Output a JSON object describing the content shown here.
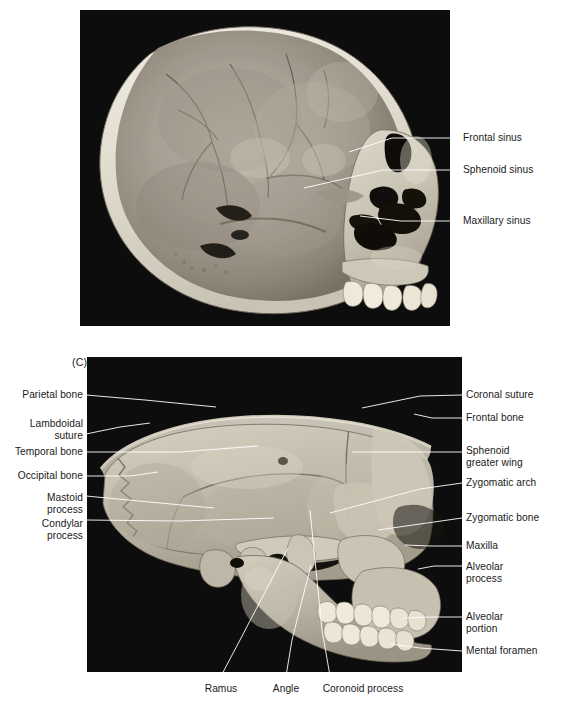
{
  "figure": {
    "panels": [
      {
        "tag": "(B)",
        "tag_pos": {
          "x": 80,
          "y": 8
        },
        "plate": {
          "x": 80,
          "y": 10,
          "w": 370,
          "h": 316
        },
        "subject": "midsagittal section of skull showing paranasal sinuses",
        "labels": [
          {
            "name": "frontal-sinus",
            "text": "Frontal sinus",
            "x": 463,
            "y": 132,
            "align": "left",
            "leader": [
              [
                458,
                138
              ],
              [
                392,
                138
              ],
              [
                349,
                152
              ]
            ]
          },
          {
            "name": "sphenoid-sinus",
            "text": "Sphenoid sinus",
            "x": 463,
            "y": 164,
            "align": "left",
            "leader": [
              [
                458,
                170
              ],
              [
                383,
                170
              ],
              [
                304,
                188
              ]
            ]
          },
          {
            "name": "maxillary-sinus",
            "text": "Maxillary sinus",
            "x": 463,
            "y": 215,
            "align": "left",
            "leader": [
              [
                458,
                221
              ],
              [
                401,
                221
              ],
              [
                360,
                216
              ]
            ]
          }
        ]
      },
      {
        "tag": "(C)",
        "tag_pos": {
          "x": 72,
          "y": 356
        },
        "plate": {
          "x": 87,
          "y": 357,
          "w": 375,
          "h": 315
        },
        "subject": "lateral view of skull with calvaria removed",
        "labels": [
          {
            "name": "parietal-bone",
            "text": "Parietal bone",
            "x": 5,
            "y": 389,
            "align": "right",
            "w": 78,
            "leader": [
              [
                86,
                395
              ],
              [
                145,
                400
              ],
              [
                216,
                407
              ]
            ]
          },
          {
            "name": "lambdoidal-suture",
            "text": "Lambdoidal\nsuture",
            "x": 5,
            "y": 418,
            "align": "right",
            "w": 78,
            "leader": [
              [
                86,
                434
              ],
              [
                120,
                427
              ],
              [
                150,
                423
              ]
            ]
          },
          {
            "name": "temporal-bone",
            "text": "Temporal bone",
            "x": 5,
            "y": 446,
            "align": "right",
            "w": 78,
            "leader": [
              [
                86,
                452
              ],
              [
                180,
                452
              ],
              [
                258,
                446
              ]
            ]
          },
          {
            "name": "occipital-bone",
            "text": "Occipital bone",
            "x": 5,
            "y": 470,
            "align": "right",
            "w": 78,
            "leader": [
              [
                86,
                476
              ],
              [
                130,
                476
              ],
              [
                158,
                472
              ]
            ]
          },
          {
            "name": "mastoid-process",
            "text": "Mastoid\nprocess",
            "x": 5,
            "y": 492,
            "align": "right",
            "w": 78,
            "leader": [
              [
                86,
                496
              ],
              [
                160,
                503
              ],
              [
                214,
                508
              ]
            ]
          },
          {
            "name": "condylar-process",
            "text": "Condylar\nprocess",
            "x": 5,
            "y": 518,
            "align": "right",
            "w": 78,
            "leader": [
              [
                86,
                520
              ],
              [
                180,
                521
              ],
              [
                274,
                518
              ]
            ]
          },
          {
            "name": "coronal-suture",
            "text": "Coronal suture",
            "x": 466,
            "y": 389,
            "align": "left",
            "leader": [
              [
                462,
                395
              ],
              [
                420,
                396
              ],
              [
                362,
                408
              ]
            ]
          },
          {
            "name": "frontal-bone",
            "text": "Frontal bone",
            "x": 466,
            "y": 412,
            "align": "left",
            "leader": [
              [
                462,
                418
              ],
              [
                432,
                418
              ],
              [
                414,
                414
              ]
            ]
          },
          {
            "name": "sphenoid-greater-wing",
            "text": "Sphenoid\ngreater wing",
            "x": 466,
            "y": 445,
            "align": "left",
            "leader": [
              [
                462,
                452
              ],
              [
                400,
                452
              ],
              [
                352,
                452
              ]
            ]
          },
          {
            "name": "zygomatic-arch",
            "text": "Zygomatic arch",
            "x": 466,
            "y": 477,
            "align": "left",
            "leader": [
              [
                462,
                483
              ],
              [
                420,
                489
              ],
              [
                330,
                513
              ]
            ]
          },
          {
            "name": "zygomatic-bone",
            "text": "Zygomatic bone",
            "x": 466,
            "y": 512,
            "align": "left",
            "leader": [
              [
                462,
                518
              ],
              [
                420,
                524
              ],
              [
                378,
                530
              ]
            ]
          },
          {
            "name": "maxilla",
            "text": "Maxilla",
            "x": 466,
            "y": 540,
            "align": "left",
            "leader": [
              [
                462,
                546
              ],
              [
                430,
                546
              ],
              [
                405,
                545
              ]
            ]
          },
          {
            "name": "alveolar-process",
            "text": "Alveolar\nprocess",
            "x": 466,
            "y": 561,
            "align": "left",
            "leader": [
              [
                462,
                566
              ],
              [
                434,
                566
              ],
              [
                418,
                569
              ]
            ]
          },
          {
            "name": "alveolar-portion",
            "text": "Alveolar\nportion",
            "x": 466,
            "y": 611,
            "align": "left",
            "leader": [
              [
                462,
                617
              ],
              [
                430,
                617
              ],
              [
                404,
                618
              ]
            ]
          },
          {
            "name": "mental-foramen",
            "text": "Mental foramen",
            "x": 466,
            "y": 645,
            "align": "left",
            "leader": [
              [
                462,
                651
              ],
              [
                420,
                648
              ],
              [
                390,
                644
              ]
            ]
          },
          {
            "name": "ramus",
            "text": "Ramus",
            "x": 198,
            "y": 683,
            "align": "center",
            "w": 46,
            "leader": [
              [
                221,
                676
              ],
              [
                240,
                640
              ],
              [
                288,
                548
              ]
            ]
          },
          {
            "name": "angle",
            "text": "Angle",
            "x": 265,
            "y": 683,
            "align": "center",
            "w": 42,
            "leader": [
              [
                286,
                676
              ],
              [
                292,
                640
              ],
              [
                311,
                565
              ]
            ]
          },
          {
            "name": "coronoid-process",
            "text": "Coronoid process",
            "x": 310,
            "y": 683,
            "align": "center",
            "w": 106,
            "leader": [
              [
                330,
                676
              ],
              [
                322,
                630
              ],
              [
                310,
                510
              ]
            ]
          }
        ]
      }
    ]
  }
}
